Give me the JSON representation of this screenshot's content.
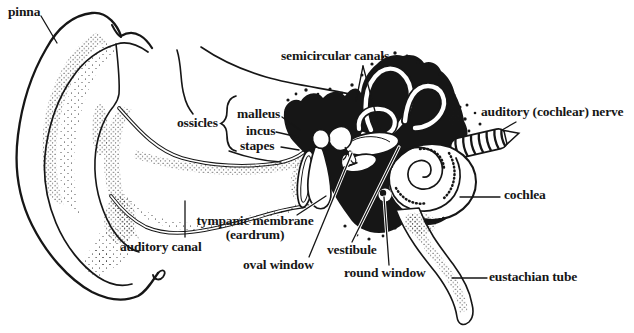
{
  "figure": {
    "ink_color": "#161616",
    "paper_color": "#ffffff",
    "labels": {
      "pinna": "pinna",
      "semicircular_canals": "semicircular canals",
      "ossicles": "ossicles",
      "malleus": "malleus",
      "incus": "incus",
      "stapes": "stapes",
      "auditory_nerve": "auditory (cochlear) nerve",
      "tympanic_membrane": "tympanic membrane",
      "tympanic_membrane_sub": "(eardrum)",
      "auditory_canal": "auditory canal",
      "oval_window": "oval window",
      "vestibule": "vestibule",
      "round_window": "round window",
      "cochlea": "cochlea",
      "eustachian_tube": "eustachian tube"
    }
  }
}
